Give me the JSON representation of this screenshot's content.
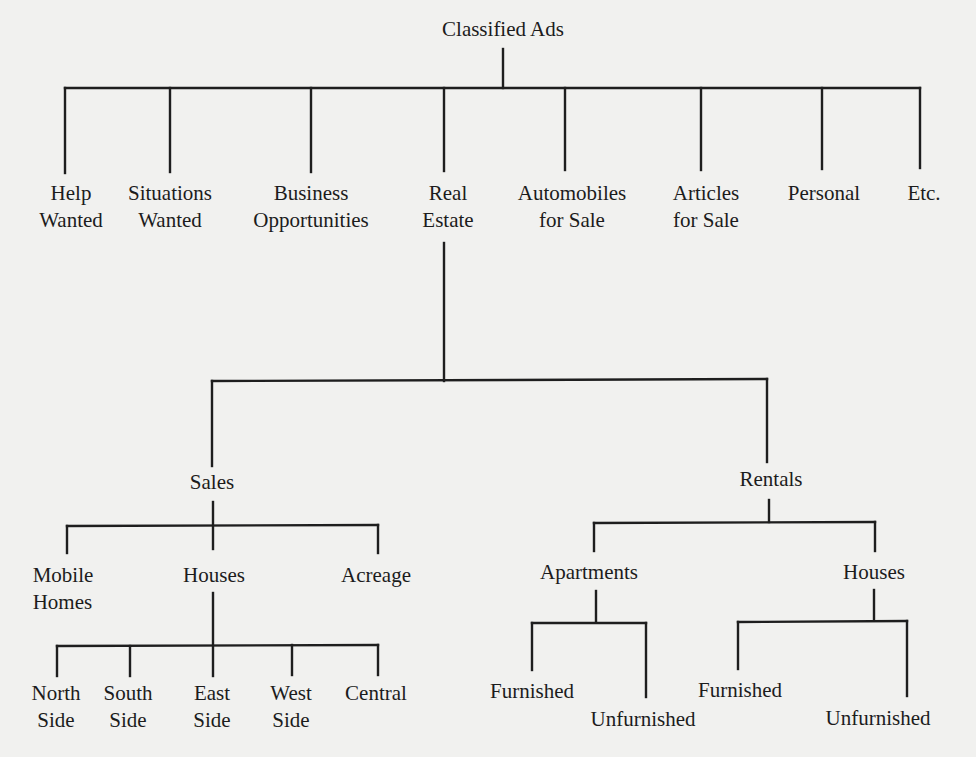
{
  "title": "Classified Ads",
  "categories": [
    {
      "lines": [
        "Help",
        "Wanted"
      ]
    },
    {
      "lines": [
        "Situations",
        "Wanted"
      ]
    },
    {
      "lines": [
        "Business",
        "Opportunities"
      ]
    },
    {
      "lines": [
        "Real",
        "Estate"
      ]
    },
    {
      "lines": [
        "Automobiles",
        "for Sale"
      ]
    },
    {
      "lines": [
        "Articles",
        "for Sale"
      ]
    },
    {
      "lines": [
        "Personal"
      ]
    },
    {
      "lines": [
        "Etc."
      ]
    }
  ],
  "real_estate": {
    "sales": {
      "label": "Sales",
      "children": [
        {
          "lines": [
            "Mobile",
            "Homes"
          ]
        },
        {
          "lines": [
            "Houses"
          ]
        },
        {
          "lines": [
            "Acreage"
          ]
        }
      ],
      "houses_children": [
        {
          "lines": [
            "North",
            "Side"
          ]
        },
        {
          "lines": [
            "South",
            "Side"
          ]
        },
        {
          "lines": [
            "East",
            "Side"
          ]
        },
        {
          "lines": [
            "West",
            "Side"
          ]
        },
        {
          "lines": [
            "Central"
          ]
        }
      ]
    },
    "rentals": {
      "label": "Rentals",
      "children": [
        {
          "label": "Apartments",
          "children": [
            "Furnished",
            "Unfurnished"
          ]
        },
        {
          "label": "Houses",
          "children": [
            "Furnished",
            "Unfurnished"
          ]
        }
      ]
    }
  }
}
